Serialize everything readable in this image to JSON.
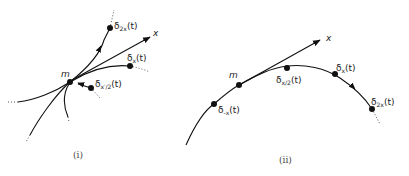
{
  "panels": [
    {
      "id": "i",
      "caption": "(i)",
      "origin_label": "m",
      "vector_label": "x",
      "points": [
        {
          "name": "delta-2x",
          "base": "δ",
          "sub": "2x",
          "arg": "(t)"
        },
        {
          "name": "delta-x",
          "base": "δ",
          "sub": "x",
          "arg": "(t)"
        },
        {
          "name": "delta-neg-x-half",
          "base": "δ",
          "sub": "x′/2",
          "arg": "(t)"
        }
      ]
    },
    {
      "id": "ii",
      "caption": "(ii)",
      "origin_label": "m",
      "vector_label": "x",
      "points": [
        {
          "name": "delta-neg-x",
          "base": "δ",
          "sub": "-x",
          "arg": "(t)"
        },
        {
          "name": "delta-x-half",
          "base": "δ",
          "sub": "x/2",
          "arg": "(t)"
        },
        {
          "name": "delta-x",
          "base": "δ",
          "sub": "x",
          "arg": "(t)"
        },
        {
          "name": "delta-2x",
          "base": "δ",
          "sub": "2x",
          "arg": "(t)"
        }
      ]
    }
  ],
  "colors": {
    "ink": "#111111",
    "background": "#ffffff"
  }
}
